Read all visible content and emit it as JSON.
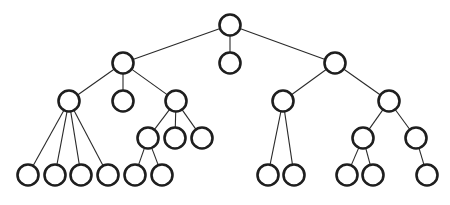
{
  "diagram": {
    "type": "tree",
    "title": "",
    "colors": {
      "node_stroke": "#1e1e1e",
      "edge": "#2a2a2a",
      "node_fill": "#ffffff",
      "background": "#ffffff"
    },
    "nodes": [
      {
        "id": "n0",
        "parent": null,
        "label": ""
      },
      {
        "id": "n1",
        "parent": "n0",
        "label": ""
      },
      {
        "id": "n2",
        "parent": "n0",
        "label": ""
      },
      {
        "id": "n3",
        "parent": "n0",
        "label": ""
      },
      {
        "id": "n4",
        "parent": "n1",
        "label": ""
      },
      {
        "id": "n5",
        "parent": "n1",
        "label": ""
      },
      {
        "id": "n6",
        "parent": "n1",
        "label": ""
      },
      {
        "id": "n7",
        "parent": "n3",
        "label": ""
      },
      {
        "id": "n8",
        "parent": "n3",
        "label": ""
      },
      {
        "id": "n9",
        "parent": "n4",
        "label": ""
      },
      {
        "id": "n10",
        "parent": "n4",
        "label": ""
      },
      {
        "id": "n11",
        "parent": "n4",
        "label": ""
      },
      {
        "id": "n12",
        "parent": "n4",
        "label": ""
      },
      {
        "id": "n13",
        "parent": "n6",
        "label": ""
      },
      {
        "id": "n14",
        "parent": "n6",
        "label": ""
      },
      {
        "id": "n15",
        "parent": "n6",
        "label": ""
      },
      {
        "id": "n16",
        "parent": "n13",
        "label": ""
      },
      {
        "id": "n17",
        "parent": "n13",
        "label": ""
      },
      {
        "id": "n18",
        "parent": "n7",
        "label": ""
      },
      {
        "id": "n19",
        "parent": "n7",
        "label": ""
      },
      {
        "id": "n20",
        "parent": "n8",
        "label": ""
      },
      {
        "id": "n21",
        "parent": "n8",
        "label": ""
      },
      {
        "id": "n22",
        "parent": "n20",
        "label": ""
      },
      {
        "id": "n23",
        "parent": "n20",
        "label": ""
      },
      {
        "id": "n24",
        "parent": "n21",
        "label": ""
      }
    ]
  }
}
